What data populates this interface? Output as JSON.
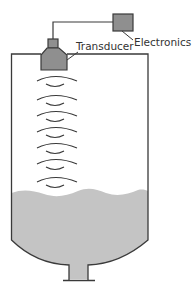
{
  "diagram": {
    "labels": {
      "transducer": "Transducer",
      "electronics": "Electronics"
    },
    "colors": {
      "outline": "#3a3a3a",
      "device_fill": "#8f8f8f",
      "liquid_fill": "#c4c4c4",
      "wave_stroke": "#3a3a3a",
      "background": "#ffffff"
    },
    "wave_count": 6
  }
}
